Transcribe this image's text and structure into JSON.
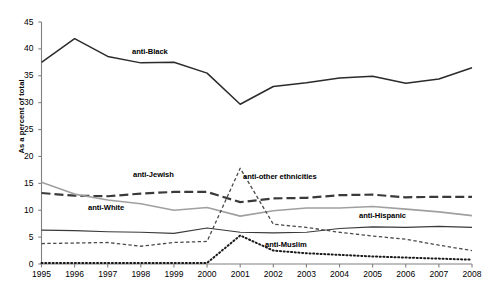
{
  "chart_data": {
    "type": "line",
    "title": "",
    "xlabel": "",
    "ylabel": "As a percent of total",
    "x": [
      1995,
      1996,
      1997,
      1998,
      1999,
      2000,
      2001,
      2002,
      2003,
      2004,
      2005,
      2006,
      2007,
      2008
    ],
    "xtick_labels": [
      "1995",
      "1996",
      "1997",
      "1998",
      "1999",
      "2000",
      "2001",
      "2002",
      "2003",
      "2004",
      "2005",
      "2006",
      "2007",
      "2008"
    ],
    "ytick_labels": [
      "0",
      "5",
      "10",
      "15",
      "20",
      "25",
      "30",
      "35",
      "40",
      "45"
    ],
    "yticks": [
      0,
      5,
      10,
      15,
      20,
      25,
      30,
      35,
      40,
      45
    ],
    "ylim": [
      0,
      45
    ],
    "xlim": [
      1995,
      2008
    ],
    "grid": false,
    "legend": "inline-labels",
    "series": [
      {
        "name": "anti-Black",
        "label": "anti-Black",
        "style": "solid",
        "color": "#2b2b2b",
        "width": 1.5,
        "values": [
          37.5,
          41.9,
          38.6,
          37.4,
          37.5,
          35.5,
          29.7,
          33.0,
          33.7,
          34.6,
          34.9,
          33.6,
          34.4,
          36.5
        ]
      },
      {
        "name": "anti-Jewish",
        "label": "anti-Jewish",
        "style": "long-dash",
        "color": "#3a3a3a",
        "width": 2.2,
        "values": [
          13.2,
          12.7,
          12.6,
          13.1,
          13.4,
          13.4,
          11.5,
          12.2,
          12.3,
          12.8,
          12.9,
          12.4,
          12.5,
          12.5
        ]
      },
      {
        "name": "anti-White",
        "label": "anti-White",
        "style": "solid",
        "color": "#a0a0a0",
        "width": 1.6,
        "values": [
          15.2,
          13.0,
          11.9,
          11.2,
          10.0,
          10.5,
          8.9,
          9.9,
          10.4,
          10.4,
          10.7,
          10.2,
          9.7,
          9.0
        ]
      },
      {
        "name": "anti-Hispanic",
        "label": "anti-Hispanic",
        "style": "solid",
        "color": "#3a3a3a",
        "width": 1.2,
        "values": [
          6.3,
          6.2,
          6.0,
          5.9,
          5.7,
          6.7,
          5.9,
          5.8,
          5.9,
          6.6,
          6.9,
          6.8,
          7.0,
          6.8
        ]
      },
      {
        "name": "anti-other ethnicities",
        "label": "anti-other ethnicities",
        "style": "short-dash",
        "color": "#4a4a4a",
        "width": 1.3,
        "values": [
          3.8,
          3.9,
          4.0,
          3.3,
          4.0,
          4.2,
          17.8,
          7.4,
          6.8,
          5.9,
          5.2,
          4.6,
          3.5,
          2.5
        ]
      },
      {
        "name": "anti-Muslim",
        "label": "anti-Muslim",
        "style": "dotted",
        "color": "#1a1a1a",
        "width": 2.0,
        "values": [
          0.2,
          0.2,
          0.2,
          0.2,
          0.2,
          0.2,
          5.3,
          2.5,
          2.0,
          1.7,
          1.4,
          1.2,
          1.0,
          0.8
        ]
      }
    ],
    "annotations": [
      {
        "text": "anti-Black",
        "x": 132,
        "y": 47
      },
      {
        "text": "anti-Jewish",
        "x": 133,
        "y": 170
      },
      {
        "text": "anti-White",
        "x": 88,
        "y": 203
      },
      {
        "text": "anti-other ethnicities",
        "x": 243,
        "y": 172
      },
      {
        "text": "anti-Hispanic",
        "x": 359,
        "y": 211
      },
      {
        "text": "anti-Muslim",
        "x": 265,
        "y": 240
      }
    ]
  }
}
